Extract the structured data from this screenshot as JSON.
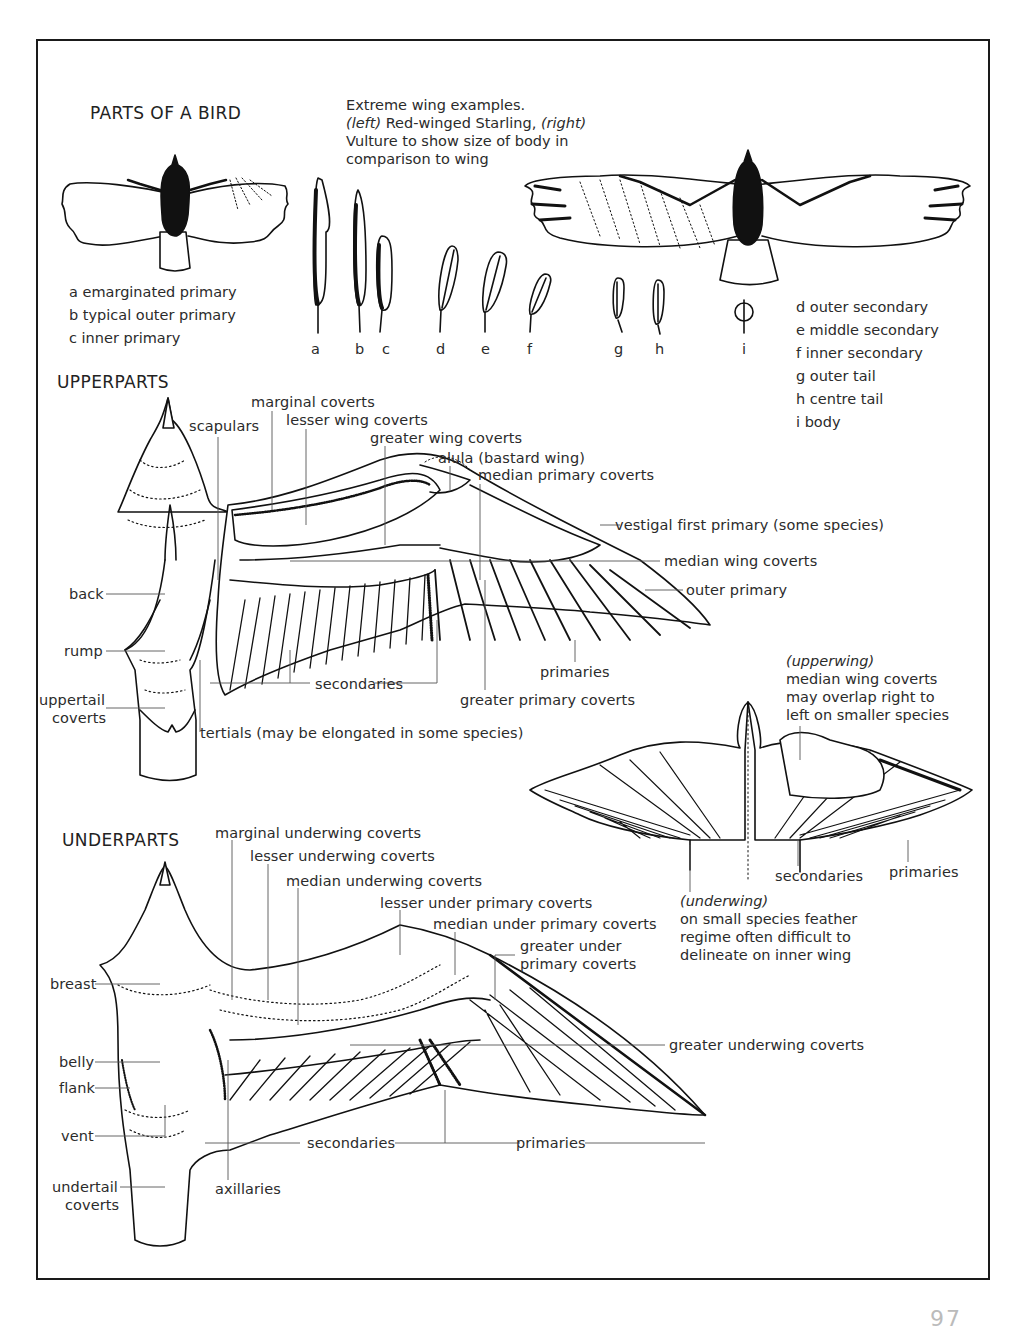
{
  "page": {
    "title": "PARTS OF A BIRD",
    "page_number_partial": "97"
  },
  "wing_examples": {
    "caption_line1": "Extreme wing examples.",
    "caption_left_tag": "(left)",
    "caption_left_text": " Red-winged Starling, ",
    "caption_right_tag": "(right)",
    "caption_line3": "Vulture to show size of body in",
    "caption_line4": "comparison to wing"
  },
  "feathers": {
    "letters": [
      "a",
      "b",
      "c",
      "d",
      "e",
      "f",
      "g",
      "h",
      "i"
    ],
    "legend_left": [
      "a emarginated primary",
      "b typical outer primary",
      "c inner primary"
    ],
    "legend_right": [
      "d outer secondary",
      "e middle secondary",
      "f inner secondary",
      "g outer tail",
      "h centre tail",
      "i body"
    ]
  },
  "upperparts": {
    "heading": "UPPERPARTS",
    "labels": {
      "marginal_coverts": "marginal coverts",
      "scapulars": "scapulars",
      "lesser_wing_coverts": "lesser wing coverts",
      "greater_wing_coverts": "greater wing coverts",
      "alula": "alula (bastard wing)",
      "median_primary_coverts": "median primary coverts",
      "vestigal_first_primary": "vestigal first primary (some species)",
      "median_wing_coverts": "median wing coverts",
      "outer_primary": "outer primary",
      "back": "back",
      "rump": "rump",
      "uppertail_coverts_1": "uppertail",
      "uppertail_coverts_2": "coverts",
      "secondaries": "secondaries",
      "primaries": "primaries",
      "greater_primary_coverts": "greater primary coverts",
      "tertials": "tertials (may be elongated in some species)"
    }
  },
  "small_species": {
    "upperwing_tag": "(upperwing)",
    "upperwing_note": [
      "median wing coverts",
      "may overlap right to",
      "left on smaller species"
    ],
    "secondaries": "secondaries",
    "primaries": "primaries",
    "underwing_tag": "(underwing)",
    "underwing_note": [
      "on small species feather",
      "regime often difficult to",
      "delineate on inner wing"
    ]
  },
  "underparts": {
    "heading": "UNDERPARTS",
    "labels": {
      "marginal_underwing_coverts": "marginal underwing coverts",
      "lesser_underwing_coverts": "lesser underwing coverts",
      "median_underwing_coverts": "median underwing coverts",
      "lesser_under_primary_coverts": "lesser under primary coverts",
      "median_under_primary_coverts": "median under primary coverts",
      "greater_under_primary_coverts_1": "greater under",
      "greater_under_primary_coverts_2": "primary coverts",
      "breast": "breast",
      "greater_underwing_coverts": "greater underwing coverts",
      "belly": "belly",
      "flank": "flank",
      "vent": "vent",
      "secondaries": "secondaries",
      "primaries": "primaries",
      "undertail_coverts_1": "undertail",
      "undertail_coverts_2": "coverts",
      "axillaries": "axillaries"
    }
  }
}
